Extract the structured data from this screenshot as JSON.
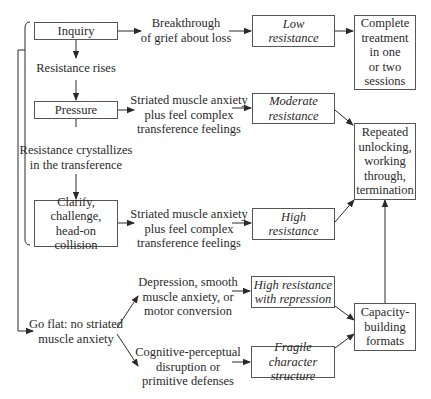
{
  "diagram": {
    "nodes": {
      "inquiry": "Inquiry",
      "resistance_rises": "Resistance rises",
      "pressure": "Pressure",
      "resistance_crystallizes": "Resistance crystallizes\nin the transference",
      "clarify": "Clarify,\nchallenge,\nhead-on collision",
      "go_flat": "Go flat: no striated\nmuscle anxiety",
      "breakthrough": "Breakthrough\nof grief about loss",
      "striated_1": "Striated muscle anxiety\nplus feel complex\ntransference feelings",
      "striated_2": "Striated muscle anxiety\nplus feel complex\ntransference feelings",
      "depression": "Depression, smooth\nmuscle anxiety, or\nmotor conversion",
      "cognitive": "Cognitive-perceptual\ndisruption or\nprimitive defenses",
      "low_resistance": "Low\nresistance",
      "moderate_resistance": "Moderate\nresistance",
      "high_resistance": "High\nresistance",
      "high_resistance_repression": "High resistance\nwith repression",
      "fragile_character": "Fragile character\nstructure",
      "complete_treatment": "Complete\ntreatment\nin one\nor two\nsessions",
      "repeated_unlocking": "Repeated\nunlocking,\nworking\nthrough,\ntermination",
      "capacity_building": "Capacity-\nbuilding\nformats"
    },
    "edges": [
      [
        "inquiry",
        "resistance_rises"
      ],
      [
        "resistance_rises",
        "pressure"
      ],
      [
        "pressure",
        "resistance_crystallizes"
      ],
      [
        "resistance_crystallizes",
        "clarify"
      ],
      [
        "inquiry",
        "breakthrough"
      ],
      [
        "breakthrough",
        "low_resistance"
      ],
      [
        "low_resistance",
        "complete_treatment"
      ],
      [
        "pressure",
        "striated_1"
      ],
      [
        "striated_1",
        "moderate_resistance"
      ],
      [
        "moderate_resistance",
        "repeated_unlocking"
      ],
      [
        "clarify",
        "striated_2"
      ],
      [
        "striated_2",
        "high_resistance"
      ],
      [
        "high_resistance",
        "repeated_unlocking"
      ],
      [
        "brace_inquiry_to_clarify",
        "go_flat"
      ],
      [
        "go_flat",
        "depression"
      ],
      [
        "go_flat",
        "cognitive"
      ],
      [
        "depression",
        "high_resistance_repression"
      ],
      [
        "cognitive",
        "fragile_character"
      ],
      [
        "high_resistance_repression",
        "capacity_building"
      ],
      [
        "fragile_character",
        "capacity_building"
      ],
      [
        "capacity_building",
        "repeated_unlocking"
      ]
    ],
    "colors": {
      "line": "#2a2a2a",
      "border": "#555555",
      "background": "#ffffff"
    }
  }
}
